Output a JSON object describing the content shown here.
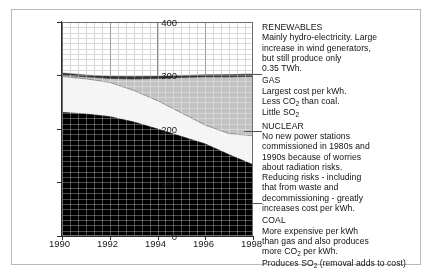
{
  "chart_data": {
    "type": "area",
    "stacked": true,
    "title": "",
    "xlabel": "",
    "ylabel": "Electricity (TWh)",
    "xlim": [
      1990,
      1998
    ],
    "ylim": [
      0,
      400
    ],
    "xticks": [
      1990,
      1992,
      1994,
      1996,
      1998
    ],
    "yticks": [
      0,
      100,
      200,
      300,
      400
    ],
    "grid": true,
    "legend_position": "right-annotations",
    "x": [
      1990,
      1991,
      1992,
      1993,
      1994,
      1995,
      1996,
      1997,
      1998
    ],
    "series": [
      {
        "name": "COAL",
        "color": "#000000",
        "values": [
          230,
          228,
          223,
          213,
          200,
          186,
          172,
          152,
          133
        ]
      },
      {
        "name": "NUCLEAR",
        "color": "#f2f2f2",
        "values": [
          70,
          68,
          66,
          63,
          60,
          58,
          57,
          60,
          64
        ]
      },
      {
        "name": "GAS",
        "color": "#b8b8b8",
        "values": [
          14,
          14,
          18,
          28,
          44,
          62,
          78,
          95,
          110
        ]
      },
      {
        "name": "RENEWABLES",
        "color": "#2f2f2f",
        "values": [
          4,
          4,
          4,
          4,
          4,
          4,
          4,
          4,
          5
        ]
      }
    ],
    "totals": [
      318,
      314,
      311,
      308,
      308,
      310,
      311,
      311,
      312
    ]
  },
  "axes": {
    "yticks": [
      "400",
      "300",
      "200",
      "100",
      "0"
    ],
    "xticks": [
      "1990",
      "1992",
      "1994",
      "1996",
      "1998"
    ],
    "ylabel": "Electricity (TWh)"
  },
  "annotations": [
    {
      "key": "renewables",
      "title": "RENEWABLES",
      "lines": [
        "Mainly hydro-electricity. Large",
        "increase in wind generators,",
        "but still produce only",
        "0.35 TWh."
      ]
    },
    {
      "key": "gas",
      "title": "GAS",
      "lines": [
        "Largest cost per kWh.",
        "Less CO|2| than coal.",
        "Little SO|2|"
      ]
    },
    {
      "key": "nuclear",
      "title": "NUCLEAR",
      "lines": [
        "No new power stations",
        "commissioned in 1980s and",
        "1990s because of worries",
        "about radiation risks.",
        "Reducing risks - including",
        "that from waste and",
        "decommissioning - greatly",
        "increases cost per kWh."
      ]
    },
    {
      "key": "coal",
      "title": "COAL",
      "lines": [
        "More expensive per kWh",
        "than gas and also produces",
        "more CO|2| per kWh.",
        "Produces SO|2| (removal adds to cost)"
      ]
    }
  ]
}
